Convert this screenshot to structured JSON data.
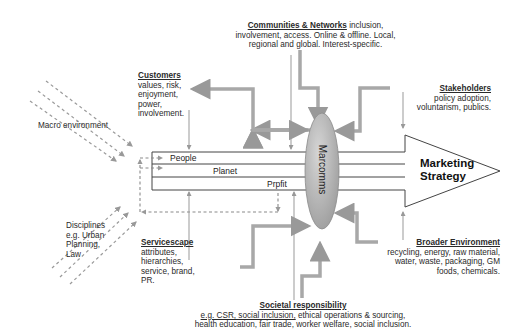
{
  "diagram": {
    "center_node": "Marcomms",
    "main_arrow": {
      "line1": "Marketing",
      "line2": "Strategy"
    },
    "bands": [
      "People",
      "Planet",
      "Prpfit"
    ],
    "nodes": {
      "communities": {
        "heading": "Communities & Networks",
        "text": " inclusion, involvement, access. Online & offline. Local, regional and global. Interest-specific."
      },
      "customers": {
        "heading": "Customers",
        "lines": [
          "values, risk,",
          "enjoyment,",
          "power,",
          "involvement."
        ]
      },
      "stakeholders": {
        "heading": "Stakeholders",
        "lines": [
          "policy adoption,",
          "voluntarism, publics."
        ]
      },
      "macro": {
        "label": "Macro environment"
      },
      "disciplines": {
        "lines": [
          "Disciplines",
          "e.g. Urban",
          "Planning,",
          "Law"
        ]
      },
      "servicescape": {
        "heading": "Servicescape",
        "lines": [
          "attributes,",
          "hierarchies,",
          "service, brand,",
          "PR."
        ]
      },
      "broader": {
        "heading": "Broader Environment",
        "lines": [
          "recycling, energy, raw material,",
          "water, waste, packaging, GM",
          "foods, chemicals."
        ]
      },
      "societal": {
        "heading": "Societal responsibility",
        "line1_underlined": "e.g. CSR, social inclusion,",
        "line1_rest": " ethical operations & sourcing,",
        "line2": "health education, fair trade, worker welfare, social inclusion."
      }
    },
    "colors": {
      "line": "#555555",
      "thick_arrow": "#a8a8a8",
      "dashed": "#9a9a9a",
      "ellipse_fill": "#b8b8b8"
    }
  }
}
